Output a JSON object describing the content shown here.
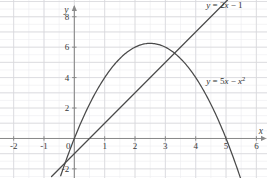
{
  "chart_data": {
    "type": "line",
    "title": "",
    "subtitle": "",
    "xlabel": "x",
    "ylabel": "y",
    "xlim": [
      -2.45,
      6.35
    ],
    "ylim": [
      -2.6,
      9.1
    ],
    "grid": true,
    "grid_major_step": 1,
    "grid_minor_step": 0.5,
    "legend": "inline-curve-labels",
    "x_ticks": [
      -2,
      -1,
      0,
      1,
      2,
      3,
      4,
      5,
      6
    ],
    "x_tick_labels": [
      "-2",
      "-1",
      "0",
      "1",
      "2",
      "3",
      "4",
      "5",
      "6"
    ],
    "y_ticks": [
      -2,
      2,
      4,
      6,
      8
    ],
    "y_tick_labels": [
      "-2",
      "2",
      "4",
      "6",
      "8"
    ],
    "axis_arrow_x": true,
    "axis_arrow_y": true,
    "series": [
      {
        "name": "line",
        "label": "y = 2x − 1",
        "label_parts": {
          "lhs": "y",
          "eq": " = 2",
          "var": "x",
          "rhs": " − 1"
        },
        "equation": "y = 2x - 1",
        "type": "line",
        "color": "#4a4a4a",
        "x": [
          -0.75,
          5.05
        ],
        "y": [
          -2.5,
          9.1
        ],
        "slope": 2,
        "intercept": -1,
        "label_x": 4.35,
        "label_y": 8.6
      },
      {
        "name": "parabola",
        "label": "y = 5x − x²",
        "label_parts": {
          "lhs": "y",
          "eq": " = 5",
          "var": "x",
          "rhs": " − ",
          "var2": "x",
          "sup": "2"
        },
        "equation": "y = 5x - x^2",
        "type": "parabola",
        "color": "#4a4a4a",
        "vertex_x": 2.5,
        "vertex_y": 6.25,
        "roots": [
          0,
          5
        ],
        "x_range": [
          -0.45,
          5.5
        ],
        "label_x": 4.35,
        "label_y": 3.55
      }
    ],
    "intersections": [
      {
        "x": 0.21,
        "y": -0.58
      },
      {
        "x": 3.3,
        "y": 5.6
      }
    ],
    "colors": {
      "curve": "#4a4a4a",
      "axis": "#8a8a8a",
      "grid_major": "#d8d8dc",
      "grid_minor": "#ededf0",
      "background": "#ffffff",
      "tick_text": "#3a3a3a"
    }
  },
  "axis_names": {
    "x": "x",
    "y": "y"
  }
}
